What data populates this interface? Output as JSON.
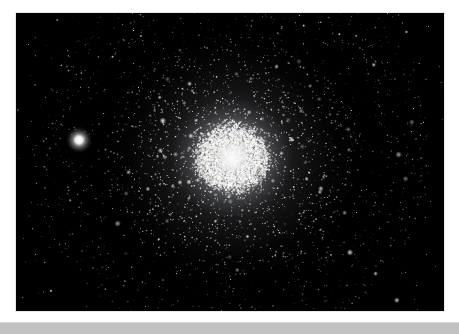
{
  "page": {
    "background_color": "#ffffff",
    "width": 459,
    "height": 334
  },
  "photo": {
    "alt_text": "Globular star cluster",
    "background_color": "#000000",
    "border_color": "#e8e8e8",
    "x": 15,
    "y": 12,
    "width": 430,
    "height": 300
  },
  "cluster": {
    "label": "globular-cluster",
    "center_x": 216,
    "center_y": 145,
    "core_radius": 32,
    "halo_radius": 122,
    "core_color": "#ffffff",
    "halo_color": "#e8ecff",
    "core_star_count": 5200,
    "halo_star_count": 2600,
    "field_star_count": 420
  },
  "bright_field_star": {
    "label": "bright-foreground-star",
    "x": 63,
    "y": 127,
    "radius": 5.0,
    "color": "#ffffff"
  },
  "bottom_bar": {
    "label": "bottom-strip",
    "color": "#c2c2c2",
    "top_edge_color": "#d6d6d6",
    "y": 322,
    "height": 12
  }
}
